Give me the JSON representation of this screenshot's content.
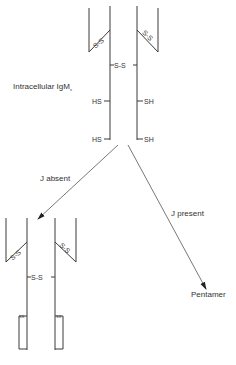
{
  "diagram": {
    "type": "IgM assembly pathway diagram",
    "labels": {
      "intracellular": "Intracellular IgM",
      "intracellular_sub": "s",
      "j_absent": "J absent",
      "j_present": "J present",
      "pentamer": "Pentamer"
    },
    "bonds": {
      "ss": "S-S",
      "hs": "HS",
      "sh": "SH",
      "small_ss": "SS"
    },
    "colors": {
      "line": "#3a3a3a",
      "text": "#333333",
      "background": "#ffffff"
    }
  }
}
